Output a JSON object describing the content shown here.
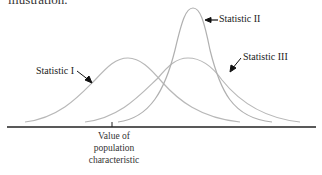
{
  "header": {
    "text": "illustration."
  },
  "diagram": {
    "curves": [
      {
        "name": "Statistic I",
        "description": "wide, centered near true value"
      },
      {
        "name": "Statistic II",
        "description": "narrow, tall, shifted right"
      },
      {
        "name": "Statistic III",
        "description": "wide, shifted right"
      }
    ],
    "labels": {
      "stat1": "Statistic I",
      "stat2": "Statistic II",
      "stat3": "Statistic III"
    },
    "axis_label": "Value of population characteristic",
    "colors": {
      "curve": "#b5b5b5",
      "axis": "#222222",
      "arrow": "#111111"
    }
  }
}
